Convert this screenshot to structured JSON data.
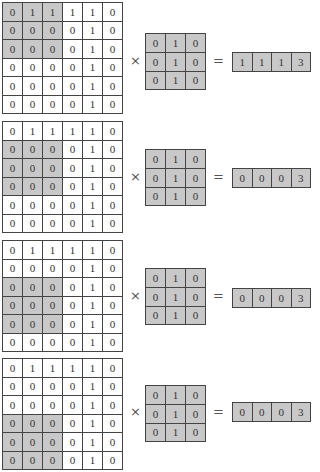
{
  "colors": {
    "highlight": "#c8c8c8",
    "border": "#444444",
    "background": "#ffffff"
  },
  "operators": {
    "times": "×",
    "equals": "="
  },
  "input_matrix": [
    [
      "0",
      "1",
      "1",
      "1",
      "1",
      "0"
    ],
    [
      "0",
      "0",
      "0",
      "0",
      "1",
      "0"
    ],
    [
      "0",
      "0",
      "0",
      "0",
      "1",
      "0"
    ],
    [
      "0",
      "0",
      "0",
      "0",
      "1",
      "0"
    ],
    [
      "0",
      "0",
      "0",
      "0",
      "1",
      "0"
    ],
    [
      "0",
      "0",
      "0",
      "0",
      "1",
      "0"
    ]
  ],
  "kernel": [
    [
      "0",
      "1",
      "0"
    ],
    [
      "0",
      "1",
      "0"
    ],
    [
      "0",
      "1",
      "0"
    ]
  ],
  "steps": [
    {
      "highlight_rows": [
        0,
        1,
        2
      ],
      "highlight_cols": [
        0,
        1,
        2
      ],
      "result": [
        "1",
        "1",
        "1",
        "3"
      ]
    },
    {
      "highlight_rows": [
        1,
        2,
        3
      ],
      "highlight_cols": [
        0,
        1,
        2
      ],
      "result": [
        "0",
        "0",
        "0",
        "3"
      ]
    },
    {
      "highlight_rows": [
        2,
        3,
        4
      ],
      "highlight_cols": [
        0,
        1,
        2
      ],
      "result": [
        "0",
        "0",
        "0",
        "3"
      ]
    },
    {
      "highlight_rows": [
        3,
        4,
        5
      ],
      "highlight_cols": [
        0,
        1,
        2
      ],
      "result": [
        "0",
        "0",
        "0",
        "3"
      ]
    }
  ]
}
